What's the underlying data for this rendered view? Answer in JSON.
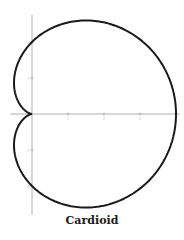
{
  "chart_data": {
    "type": "line",
    "title": "Cardioid",
    "equation": "r = 2(1 + cos θ)",
    "param": {
      "a": 2,
      "theta_range": [
        0,
        6.283185
      ]
    },
    "xlabel": "",
    "ylabel": "",
    "xlim": [
      -0.6,
      4.1
    ],
    "ylim": [
      -2.8,
      2.75
    ],
    "x_ticks": [
      1,
      2,
      3
    ],
    "y_ticks": [
      -2,
      -1,
      1,
      2
    ],
    "x_tick_labels": [
      "1",
      "2",
      "3"
    ],
    "y_tick_labels": [
      "-2",
      "-1",
      "1",
      "2"
    ],
    "grid": false,
    "series": [
      {
        "name": "cardioid",
        "color": "#1a1a1a"
      }
    ],
    "axis_color": "#9a9a9a"
  }
}
